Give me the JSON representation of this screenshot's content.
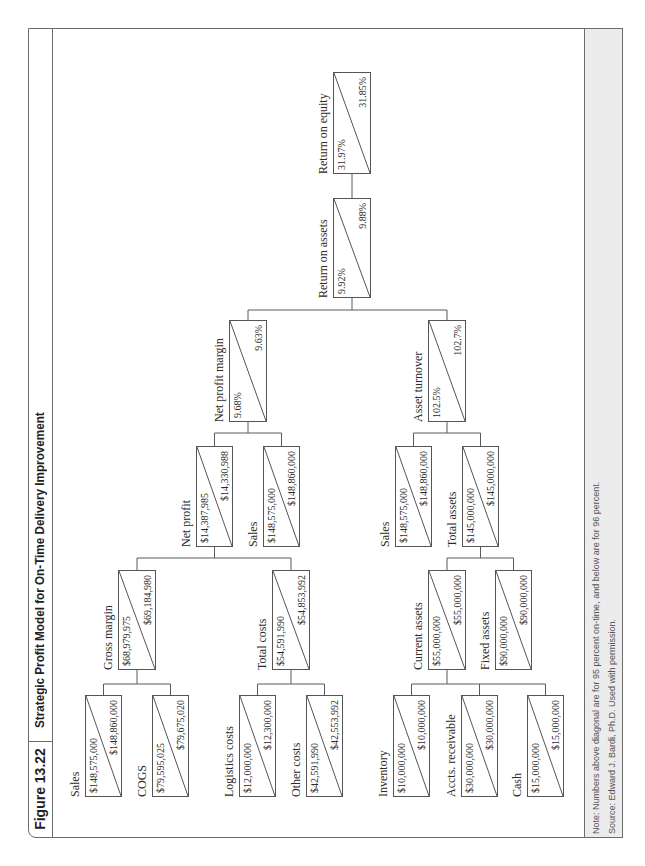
{
  "figure": {
    "number": "Figure 13.22",
    "title": "Strategic Profit Model for On-Time Delivery Improvement"
  },
  "nodes": {
    "sales_1": {
      "label": "Sales",
      "above": "$148,575,000",
      "below": "$148,860,000"
    },
    "cogs": {
      "label": "COGS",
      "above": "$79,595,025",
      "below": "$79,675,020"
    },
    "logistics_costs": {
      "label": "Logistics costs",
      "above": "$12,000,000",
      "below": "$12,300,000"
    },
    "other_costs": {
      "label": "Other costs",
      "above": "$42,591,990",
      "below": "$42,553,992"
    },
    "inventory": {
      "label": "Inventory",
      "above": "$10,000,000",
      "below": "$10,000,000"
    },
    "accts_receivable": {
      "label": "Accts. receivable",
      "above": "$30,000,000",
      "below": "$30,000,000"
    },
    "cash": {
      "label": "Cash",
      "above": "$15,000,000",
      "below": "$15,000,000"
    },
    "gross_margin": {
      "label": "Gross margin",
      "above": "$68,979,975",
      "below": "$69,184,980"
    },
    "total_costs": {
      "label": "Total costs",
      "above": "$54,591,990",
      "below": "$54,853,992"
    },
    "current_assets": {
      "label": "Current assets",
      "above": "$55,000,000",
      "below": "$55,000,000"
    },
    "fixed_assets": {
      "label": "Fixed assets",
      "above": "$90,000,000",
      "below": "$90,000,000"
    },
    "net_profit": {
      "label": "Net profit",
      "above": "$14,387,985",
      "below": "$14,330,988"
    },
    "sales_2": {
      "label": "Sales",
      "above": "$148,575,000",
      "below": "$148,860,000"
    },
    "sales_3": {
      "label": "Sales",
      "above": "$148,575,000",
      "below": "$148,860,000"
    },
    "total_assets": {
      "label": "Total assets",
      "above": "$145,000,000",
      "below": "$145,000,000"
    },
    "net_profit_margin": {
      "label": "Net profit margin",
      "above": "9.68%",
      "below": "9.63%"
    },
    "asset_turnover": {
      "label": "Asset turnover",
      "above": "102.5%",
      "below": "102.7%"
    },
    "return_on_assets": {
      "label": "Return on assets",
      "above": "9.92%",
      "below": "9.88%"
    },
    "return_on_equity": {
      "label": "Return on equity",
      "above": "31.97%",
      "below": "31.85%"
    }
  },
  "footer": {
    "note": "Note: Numbers above diagonal are for 95 percent on-time, and below are for 96 percent.",
    "source": "Source: Edward J. Bardi, Ph.D. Used with permission."
  }
}
